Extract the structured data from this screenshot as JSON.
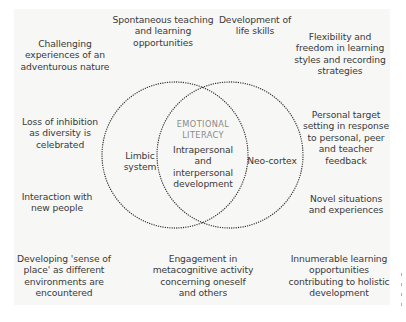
{
  "diagram": {
    "type": "venn",
    "circles": [
      {
        "label": "Limbic system",
        "cx": 175,
        "cy": 155,
        "r": 73
      },
      {
        "label": "Neo-cortex",
        "cx": 230,
        "cy": 155,
        "r": 73
      }
    ],
    "intersection": {
      "title": "EMOTIONAL\nLITERACY",
      "text": "Intrapersonal\nand\ninterpersonal\ndevelopment"
    },
    "left_circle_label": "Limbic\nsystem",
    "right_circle_label": "Neo-cortex",
    "outer_labels": {
      "top_left": "Challenging\nexperiences of an\nadventurous nature",
      "top_center_left": "Spontaneous teaching\nand learning\nopportunities",
      "top_center_right": "Development of\nlife skills",
      "top_right": "Flexibility and\nfreedom in learning\nstyles and recording\nstrategies",
      "mid_left_upper": "Loss of inhibition\nas diversity is\ncelebrated",
      "mid_right_upper": "Personal target\nsetting in response\nto personal, peer\nand teacher\nfeedback",
      "mid_left_lower": "Interaction with\nnew people",
      "mid_right_lower": "Novel situations\nand experiences",
      "bottom_left": "Developing 'sense of\nplace' as different\nenvironments are\nencountered",
      "bottom_center": "Engagement in\nmetacognitive activity\nconcerning oneself\nand others",
      "bottom_right": "Innumerable learning\nopportunities\ncontributing to holistic\ndevelopment"
    },
    "colors": {
      "panel": "#f7f7f6",
      "text": "#3a3a3a",
      "title_text": "#8a8a8a",
      "dotted_line": "#333333"
    }
  }
}
